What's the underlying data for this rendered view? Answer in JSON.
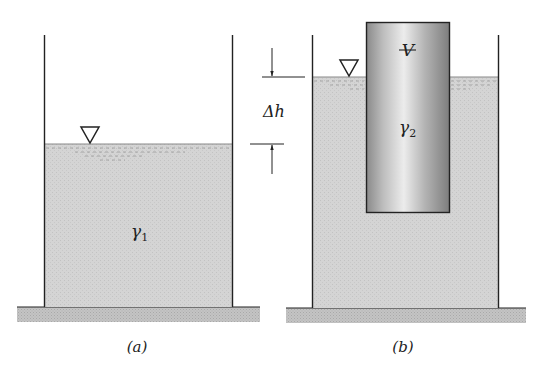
{
  "figure": {
    "panel_a": {
      "caption": "(a)",
      "fluid_label": "γ",
      "fluid_label_sub": "1",
      "surface_symbol": "free-surface-triangle"
    },
    "panel_b": {
      "caption": "(b)",
      "body_volume_label": "V",
      "body_label": "γ",
      "body_label_sub": "2",
      "rise_label": "Δh",
      "surface_symbol": "free-surface-triangle"
    }
  },
  "colors": {
    "fluid": "#d6d6d6",
    "ground": "#bdbdbd",
    "wall": "#222222",
    "block_dark": "#8e8e8e",
    "block_light": "#e4e4e4"
  }
}
